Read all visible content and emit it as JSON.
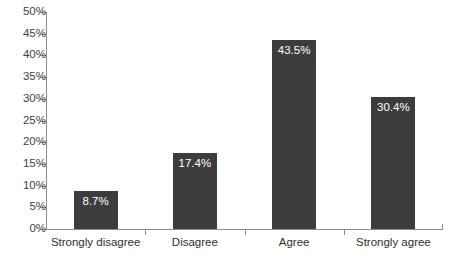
{
  "chart_data": {
    "type": "bar",
    "title": "",
    "subtitle": "",
    "xlabel": "",
    "ylabel": "",
    "categories": [
      "Strongly disagree",
      "Disagree",
      "Agree",
      "Strongly agree"
    ],
    "values": [
      8.7,
      17.4,
      43.5,
      30.4
    ],
    "value_labels": [
      "8.7%",
      "17.4%",
      "43.5%",
      "30.4%"
    ],
    "ylim": [
      0,
      50
    ],
    "ytick_step": 5,
    "ytick_labels": [
      "0%",
      "5%",
      "10%",
      "15%",
      "20%",
      "25%",
      "30%",
      "35%",
      "40%",
      "45%",
      "50%"
    ],
    "ytick_values": [
      0,
      5,
      10,
      15,
      20,
      25,
      30,
      35,
      40,
      45,
      50
    ],
    "grid": false,
    "legend": false,
    "legend_position": "none",
    "series": [
      {
        "name": "",
        "values": [
          8.7,
          17.4,
          43.5,
          30.4
        ]
      }
    ],
    "colors": {
      "bar_fill": "#3c3c3c",
      "axis_line": "#8c8c8c",
      "value_label_text": "#ffffff",
      "tick_label_text": "#3f3f3f",
      "category_label_text": "#2e2e2e",
      "background": "#ffffff"
    }
  }
}
